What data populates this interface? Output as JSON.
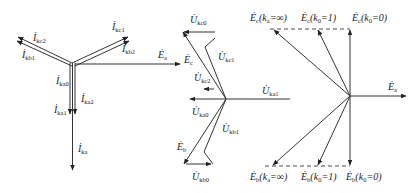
{
  "figure": {
    "panels": [
      {
        "name": "fault-current-phasors",
        "labels": {
          "ikc2": {
            "main": "İ",
            "sub": "kc2"
          },
          "ikb1": {
            "main": "İ",
            "sub": "kb1"
          },
          "ikc1": {
            "main": "İ",
            "sub": "kc1"
          },
          "ikb2": {
            "main": "İ",
            "sub": "kb2"
          },
          "ika0": {
            "main": "İ",
            "sub": "ka0"
          },
          "ika2": {
            "main": "İ",
            "sub": "ka2"
          },
          "ika1": {
            "main": "İ",
            "sub": "ka1"
          },
          "ika": {
            "main": "İ",
            "sub": "ka"
          },
          "ea": {
            "main": "Ė",
            "sub": "a"
          }
        }
      },
      {
        "name": "fault-voltage-phasors",
        "labels": {
          "ukc0": {
            "main": "U̇",
            "sub": "kc0"
          },
          "ec": {
            "main": "Ė",
            "sub": "c"
          },
          "ukc1": {
            "main": "U̇",
            "sub": "kc1"
          },
          "ukc2": {
            "main": "U̇",
            "sub": "kc2"
          },
          "uka1": {
            "main": "U̇",
            "sub": "ka1"
          },
          "uka0": {
            "main": "U̇",
            "sub": "ka0"
          },
          "ukb1": {
            "main": "U̇",
            "sub": "kb1"
          },
          "eb": {
            "main": "Ė",
            "sub": "b"
          },
          "ukb0": {
            "main": "U̇",
            "sub": "kb0"
          }
        }
      },
      {
        "name": "locus-phasors",
        "labels": {
          "ec_inf": {
            "main": "Ė",
            "sub": "c",
            "cond": "(k",
            "csub": "a",
            "ctail": "=∞)"
          },
          "ec_1": {
            "main": "Ė",
            "sub": "c",
            "cond": "(k",
            "csub": "0",
            "ctail": "=1)"
          },
          "ec_0": {
            "main": "Ė",
            "sub": "c",
            "cond": "(k",
            "csub": "0",
            "ctail": "=0)"
          },
          "eb_inf": {
            "main": "Ė",
            "sub": "b",
            "cond": "(k",
            "csub": "a",
            "ctail": "=∞)"
          },
          "eb_1": {
            "main": "Ė",
            "sub": "b",
            "cond": "(k",
            "csub": "0",
            "ctail": "=1)"
          },
          "eb_0": {
            "main": "Ė",
            "sub": "b",
            "cond": "(k",
            "csub": "0",
            "ctail": "=0)"
          },
          "ea": {
            "main": "Ė",
            "sub": "a"
          }
        }
      }
    ],
    "colors": {
      "stroke": "#333333",
      "text": "#222222",
      "background": "#ffffff"
    }
  }
}
